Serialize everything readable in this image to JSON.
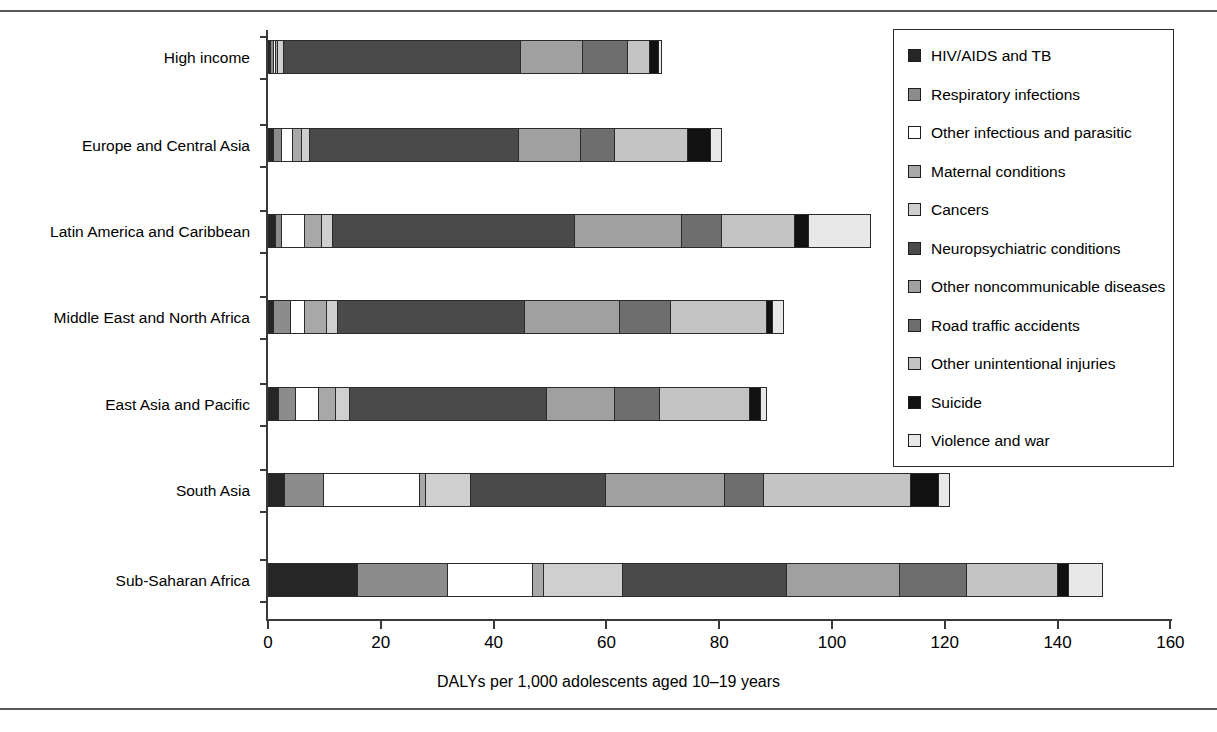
{
  "chart_data": {
    "type": "bar",
    "orientation": "horizontal",
    "stacked": true,
    "title": "",
    "xlabel": "DALYs per 1,000 adolescents aged 10–19 years",
    "ylabel": "",
    "xlim": [
      0,
      160
    ],
    "xticks": [
      0,
      20,
      40,
      60,
      80,
      100,
      120,
      140,
      160
    ],
    "grid": false,
    "legend_position": "top-right",
    "categories": [
      "High income",
      "Europe and Central Asia",
      "Latin America and Caribbean",
      "Middle East and North Africa",
      "East Asia and Pacific",
      "South Asia",
      "Sub-Saharan Africa"
    ],
    "series": [
      {
        "name": "HIV/AIDS and TB",
        "color": "#262626",
        "values": [
          0.5,
          1.0,
          1.5,
          1.0,
          2.0,
          3.0,
          16.0
        ]
      },
      {
        "name": "Respiratory infections",
        "color": "#8c8c8c",
        "values": [
          0.5,
          1.5,
          1.0,
          3.0,
          3.0,
          7.0,
          16.0
        ]
      },
      {
        "name": "Other infectious and parasitic",
        "color": "#ffffff",
        "values": [
          0.5,
          2.0,
          4.0,
          2.5,
          4.0,
          17.0,
          15.0
        ]
      },
      {
        "name": "Maternal conditions",
        "color": "#a8a8a8",
        "values": [
          0.3,
          1.5,
          3.0,
          4.0,
          3.0,
          1.0,
          2.0
        ]
      },
      {
        "name": "Cancers",
        "color": "#cfcfcf",
        "values": [
          1.0,
          1.5,
          2.0,
          2.0,
          2.5,
          8.0,
          14.0
        ]
      },
      {
        "name": "Neuropsychiatric conditions",
        "color": "#4a4a4a",
        "values": [
          42.0,
          37.0,
          43.0,
          33.0,
          35.0,
          24.0,
          29.0
        ]
      },
      {
        "name": "Other noncommunicable diseases",
        "color": "#a0a0a0",
        "values": [
          11.0,
          11.0,
          19.0,
          17.0,
          12.0,
          21.0,
          20.0
        ]
      },
      {
        "name": "Road traffic accidents",
        "color": "#6e6e6e",
        "values": [
          8.0,
          6.0,
          7.0,
          9.0,
          8.0,
          7.0,
          12.0
        ]
      },
      {
        "name": "Other unintentional injuries",
        "color": "#c4c4c4",
        "values": [
          4.0,
          13.0,
          13.0,
          17.0,
          16.0,
          26.0,
          16.0
        ]
      },
      {
        "name": "Suicide",
        "color": "#111111",
        "values": [
          1.5,
          4.0,
          2.5,
          1.0,
          2.0,
          5.0,
          2.0
        ]
      },
      {
        "name": "Violence and war",
        "color": "#e8e8e8",
        "values": [
          0.5,
          2.0,
          11.0,
          2.0,
          1.0,
          2.0,
          6.0
        ]
      }
    ],
    "totals": [
      69.8,
      80.5,
      107.0,
      91.5,
      88.5,
      121.0,
      148.0
    ]
  },
  "axis": {
    "tick_labels": [
      "0",
      "20",
      "40",
      "60",
      "80",
      "100",
      "120",
      "140",
      "160"
    ],
    "x_title": "DALYs per 1,000 adolescents aged 10–19 years"
  },
  "legend": {
    "items": [
      {
        "label": "HIV/AIDS and TB",
        "swatch": "#262626"
      },
      {
        "label": "Respiratory infections",
        "swatch": "#8c8c8c"
      },
      {
        "label": "Other infectious and parasitic",
        "swatch": "#ffffff"
      },
      {
        "label": "Maternal conditions",
        "swatch": "#a8a8a8"
      },
      {
        "label": "Cancers",
        "swatch": "#cfcfcf"
      },
      {
        "label": "Neuropsychiatric conditions",
        "swatch": "#4a4a4a"
      },
      {
        "label": "Other noncommunicable diseases",
        "swatch": "#a0a0a0"
      },
      {
        "label": "Road traffic accidents",
        "swatch": "#6e6e6e"
      },
      {
        "label": "Other unintentional injuries",
        "swatch": "#c4c4c4"
      },
      {
        "label": "Suicide",
        "swatch": "#111111"
      },
      {
        "label": "Violence and war",
        "swatch": "#e8e8e8"
      }
    ]
  }
}
